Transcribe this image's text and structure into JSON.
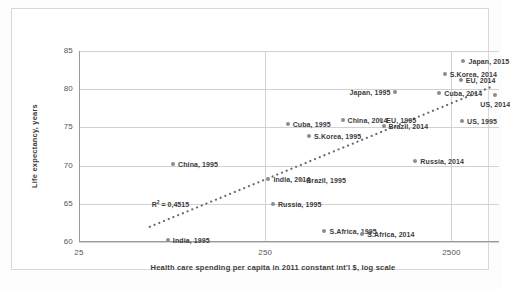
{
  "chart_data": {
    "type": "scatter",
    "title": "",
    "xlabel": "Health care spending per capita in 2011 constant int'l $, log scale",
    "ylabel": "Life expectancy, years",
    "xscale": "log",
    "xticks": [
      "25",
      "250",
      "2500"
    ],
    "xtick_values": [
      25,
      250,
      2500
    ],
    "yticks": [
      "60",
      "65",
      "70",
      "75",
      "80",
      "85"
    ],
    "ytick_values": [
      60,
      65,
      70,
      75,
      80,
      85
    ],
    "ylim": [
      60,
      85
    ],
    "xlim": [
      25,
      4500
    ],
    "grid": "horizontal-and-vertical",
    "legend": "none",
    "annotation": "R² = 0,4515",
    "trendline": {
      "style": "dotted",
      "color": "#6b6b6b"
    },
    "marker_color": "#8c8c8c",
    "points": [
      {
        "label": "India, 1995",
        "x": 75,
        "y": 60.3,
        "label_pos": "right"
      },
      {
        "label": "China, 1995",
        "x": 80,
        "y": 70.2,
        "label_pos": "right"
      },
      {
        "label": "Russia, 1995",
        "x": 275,
        "y": 65.0,
        "label_pos": "right"
      },
      {
        "label": "India, 2014",
        "x": 260,
        "y": 68.3,
        "label_pos": "right"
      },
      {
        "label": "Brazil, 1995",
        "x": 390,
        "y": 68.1,
        "label_pos": "right"
      },
      {
        "label": "S.Africa, 1995",
        "x": 520,
        "y": 61.4,
        "label_pos": "right"
      },
      {
        "label": "S.Africa, 2014",
        "x": 830,
        "y": 61.0,
        "label_pos": "right"
      },
      {
        "label": "S.Korea, 1995",
        "x": 430,
        "y": 73.9,
        "label_pos": "right"
      },
      {
        "label": "Cuba, 1995",
        "x": 330,
        "y": 75.5,
        "label_pos": "right"
      },
      {
        "label": "China, 2014",
        "x": 650,
        "y": 76.0,
        "label_pos": "right"
      },
      {
        "label": "EU, 1995",
        "x": 1050,
        "y": 76.0,
        "label_pos": "right"
      },
      {
        "label": "Brazil, 2014",
        "x": 1080,
        "y": 75.2,
        "label_pos": "right"
      },
      {
        "label": "Japan, 1995",
        "x": 1250,
        "y": 79.6,
        "label_pos": "left"
      },
      {
        "label": "Russia, 2014",
        "x": 1600,
        "y": 70.6,
        "label_pos": "right"
      },
      {
        "label": "US, 1995",
        "x": 2850,
        "y": 75.8,
        "label_pos": "right"
      },
      {
        "label": "Cuba, 2014",
        "x": 2150,
        "y": 79.5,
        "label_pos": "right"
      },
      {
        "label": "S.Korea, 2014",
        "x": 2300,
        "y": 82.0,
        "label_pos": "right"
      },
      {
        "label": "EU, 2014",
        "x": 2800,
        "y": 81.2,
        "label_pos": "right"
      },
      {
        "label": "Japan, 2015",
        "x": 2900,
        "y": 83.7,
        "label_pos": "right"
      },
      {
        "label": "US, 2014",
        "x": 4300,
        "y": 79.3,
        "label_pos": "below"
      }
    ]
  }
}
